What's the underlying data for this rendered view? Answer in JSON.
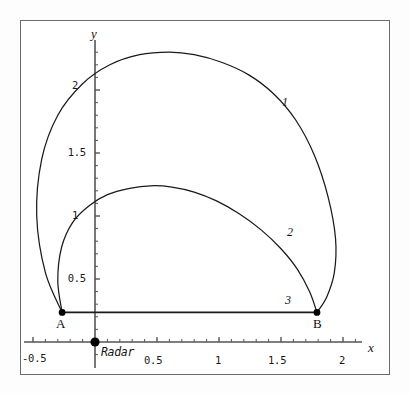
{
  "figure": {
    "background_color": "#ffffff",
    "frame_color": "#6b6b6b",
    "curve_color": "#1a1a1a",
    "axis_color": "#555555"
  },
  "axes": {
    "x_axis_label": "x",
    "y_axis_label": "y",
    "x_ticks": [
      "-0.5",
      "0.5",
      "1",
      "1.5",
      "2"
    ],
    "y_ticks": [
      "0.5",
      "1",
      "1.5",
      "2"
    ]
  },
  "annotations": {
    "point_a_label": "A",
    "point_b_label": "B",
    "radar_label": "Radar",
    "curve_1_label": "1",
    "curve_2_label": "2",
    "curve_3_label": "3"
  },
  "chart_data": {
    "type": "line",
    "title": "",
    "xlabel": "x",
    "ylabel": "y",
    "xlim": [
      -0.6,
      2.25
    ],
    "ylim": [
      -0.27,
      2.55
    ],
    "grid": false,
    "legend": "inline-curve-numbers",
    "x_ticks": [
      -0.5,
      0.5,
      1,
      1.5,
      2
    ],
    "y_ticks": [
      0.5,
      1,
      1.5,
      2
    ],
    "points": [
      {
        "name": "A",
        "x": -0.265,
        "y": 0.235,
        "marker": "filled-circle",
        "label_position": "below-left"
      },
      {
        "name": "B",
        "x": 1.79,
        "y": 0.235,
        "marker": "filled-circle",
        "label_position": "below-right"
      },
      {
        "name": "Radar",
        "x": 0.0,
        "y": 0.0,
        "marker": "filled-circle",
        "label_position": "right"
      }
    ],
    "series": [
      {
        "name": "1",
        "label": "1",
        "description": "outer arc from A up over apex near (0.72, 2.30) down to B",
        "label_at": {
          "x": 1.53,
          "y": 1.9
        },
        "x": [
          -0.265,
          -0.4,
          -0.47,
          -0.43,
          -0.3,
          -0.1,
          0.12,
          0.36,
          0.6,
          0.8,
          1.02,
          1.24,
          1.44,
          1.62,
          1.77,
          1.88,
          1.94,
          1.93,
          1.87,
          1.79
        ],
        "y": [
          0.235,
          0.55,
          1.0,
          1.45,
          1.8,
          2.05,
          2.2,
          2.28,
          2.3,
          2.28,
          2.22,
          2.12,
          1.97,
          1.76,
          1.48,
          1.15,
          0.82,
          0.55,
          0.36,
          0.235
        ]
      },
      {
        "name": "2",
        "label": "2",
        "description": "inner arc from A up over apex near (0.52, 1.24) down to B",
        "label_at": {
          "x": 1.57,
          "y": 0.88
        },
        "x": [
          -0.265,
          -0.3,
          -0.27,
          -0.18,
          -0.05,
          0.1,
          0.28,
          0.45,
          0.62,
          0.8,
          0.98,
          1.16,
          1.34,
          1.5,
          1.63,
          1.73,
          1.79
        ],
        "y": [
          0.235,
          0.48,
          0.75,
          0.95,
          1.08,
          1.17,
          1.22,
          1.24,
          1.23,
          1.19,
          1.12,
          1.02,
          0.89,
          0.74,
          0.58,
          0.4,
          0.235
        ]
      },
      {
        "name": "3",
        "label": "3",
        "description": "straight segment from A to B",
        "label_at": {
          "x": 1.55,
          "y": 0.33
        },
        "x": [
          -0.265,
          1.79
        ],
        "y": [
          0.235,
          0.235
        ]
      }
    ]
  }
}
